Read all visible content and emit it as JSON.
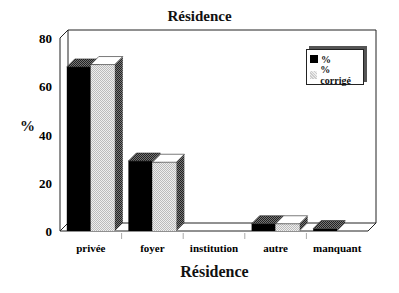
{
  "chart_data": {
    "type": "bar",
    "title": "Résidence",
    "xlabel": "Résidence",
    "ylabel": "%",
    "ylim": [
      0,
      80
    ],
    "yticks": [
      0,
      20,
      40,
      60,
      80
    ],
    "categories": [
      "privée",
      "foyer",
      "institution",
      "autre",
      "manquant"
    ],
    "series": [
      {
        "name": "%",
        "color": "#000000",
        "values": [
          68,
          29,
          0,
          3,
          1
        ]
      },
      {
        "name": "% corrigé",
        "color": "#d0d0d0",
        "values": [
          69,
          28.5,
          0,
          3,
          0
        ]
      }
    ],
    "legend_position": "top-right",
    "grid": false,
    "style": "3d"
  },
  "labels": {
    "title": "Résidence",
    "xlabel": "Résidence",
    "ylabel": "%",
    "legend": [
      "%",
      "% corrigé"
    ]
  }
}
